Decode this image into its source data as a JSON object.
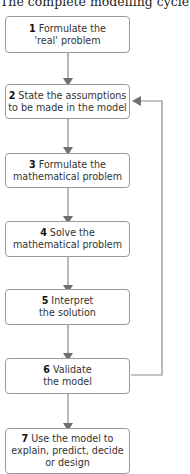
{
  "title": "The complete modelling cycle",
  "steps": [
    {
      "num": "1",
      "line1": "Formulate the",
      "line2": "'real' problem"
    },
    {
      "num": "2",
      "line1": "State the assumptions",
      "line2": "to be made in the model"
    },
    {
      "num": "3",
      "line1": "Formulate the",
      "line2": "mathematical problem"
    },
    {
      "num": "4",
      "line1": "Solve the",
      "line2": "mathematical problem"
    },
    {
      "num": "5",
      "line1": "Interpret",
      "line2": "the solution"
    },
    {
      "num": "6",
      "line1": "Validate",
      "line2": "the model"
    },
    {
      "num": "7",
      "line1": "Use the model to",
      "line2": "explain, predict, decide",
      "line3": "or design"
    }
  ],
  "colors": {
    "line": "#8a8a8a",
    "border": "#9a9a9a"
  }
}
